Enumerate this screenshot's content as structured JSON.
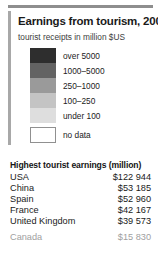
{
  "panel": {
    "title": "Earnings from tourism, 2005",
    "subtitle": "tourist receipts in million $US"
  },
  "legend": {
    "items": [
      {
        "label": "over 5000",
        "color": "#2e2e2e"
      },
      {
        "label": "1000–5000",
        "color": "#636363"
      },
      {
        "label": "250–1000",
        "color": "#9a9a9a"
      },
      {
        "label": "100–250",
        "color": "#c4c4c4"
      },
      {
        "label": "under 100",
        "color": "#dedede"
      },
      {
        "label": "no data",
        "color": "#ffffff"
      }
    ]
  },
  "table": {
    "title": "Highest tourist earnings (million)",
    "rows": [
      {
        "country": "USA",
        "value": "$122 944"
      },
      {
        "country": "China",
        "value": "$53 185"
      },
      {
        "country": "Spain",
        "value": "$52 960"
      },
      {
        "country": "France",
        "value": "$42 167"
      },
      {
        "country": "United Kingdom",
        "value": "$39 573"
      }
    ],
    "highlight_row": {
      "country": "Canada",
      "value": "$15 830"
    }
  }
}
